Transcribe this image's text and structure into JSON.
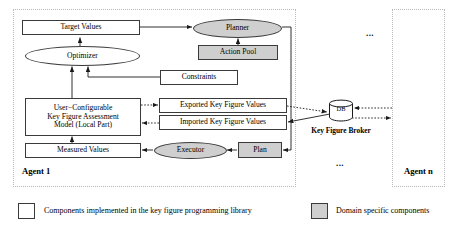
{
  "diagram": {
    "title_hidden": "",
    "agents": [
      {
        "id": "agent1",
        "label": "Agent 1"
      },
      {
        "id": "agentn",
        "label": "Agent n"
      }
    ],
    "ellipses_marks": [
      {
        "id": "dots-top",
        "text": "..."
      },
      {
        "id": "dots-bottom",
        "text": "..."
      }
    ],
    "nodes": {
      "target_values": "Target Values",
      "optimizer": "Optimizer",
      "planner": "Planner",
      "action_pool": "Action Pool",
      "constraints": "Constraints",
      "model_line1": "User−Configurable",
      "model_line2": "Key Figure Assessment",
      "model_line3": "Model (Local Part)",
      "exported": "Exported Key Figure Values",
      "imported": "Imported Key Figure Values",
      "measured_values": "Measured Values",
      "executor": "Executor",
      "plan": "Plan",
      "db": "DB",
      "key_figure_broker": "Key Figure Broker"
    },
    "legend": [
      {
        "id": "legend-library",
        "swatch": "white",
        "text": "Components implemented in the key figure programming library"
      },
      {
        "id": "legend-domain",
        "swatch": "gray",
        "text": "Domain specific components"
      }
    ],
    "colors": {
      "gray_fill": "#cfcfcf",
      "white_fill": "#ffffff",
      "stroke": "#3a3a3a",
      "dotted_border": "#b9b9b9"
    }
  }
}
